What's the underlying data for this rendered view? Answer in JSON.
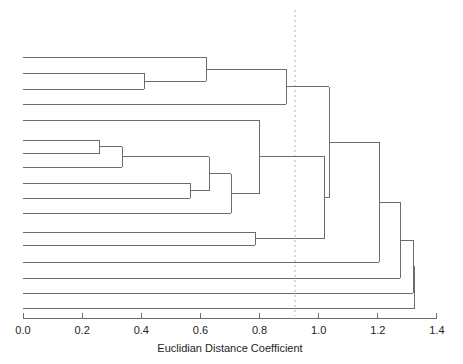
{
  "chart_data": {
    "type": "dendrogram",
    "title": "",
    "xlabel": "Euclidian Distance Coefficient",
    "ylabel": "",
    "xlim": [
      0.0,
      1.4
    ],
    "xticks": [
      0.0,
      0.2,
      0.4,
      0.6,
      0.8,
      1.0,
      1.2,
      1.4
    ],
    "xticklabels": [
      "0.0",
      "0.2",
      "0.4",
      "0.6",
      "0.8",
      "1.0",
      "1.2",
      "1.4"
    ],
    "grid": false,
    "legend": null,
    "orientation": "horizontal-left-to-right",
    "leaf_count": 17,
    "leaf_labels": [
      "",
      "",
      "",
      "",
      "",
      "",
      "",
      "",
      "",
      "",
      "",
      "",
      "",
      "",
      "",
      "",
      ""
    ],
    "leaf_order": [
      1,
      2,
      3,
      4,
      5,
      6,
      7,
      8,
      9,
      10,
      11,
      12,
      13,
      14,
      15,
      16,
      17
    ],
    "cut_line": {
      "value": 0.92,
      "style": "dashed",
      "color": "#c9a9a9",
      "label": ""
    },
    "line_color": "#6d6d6d",
    "axis_color": "#6d6d6d",
    "background": "#ffffff",
    "merges": [
      {
        "id": "m1",
        "left": "leaf2",
        "right": "leaf3",
        "height": 0.41
      },
      {
        "id": "m2",
        "left": "leaf1",
        "right": "m1",
        "height": 0.62
      },
      {
        "id": "m3",
        "left": "m2",
        "right": "leaf4",
        "height": 0.89
      },
      {
        "id": "m4",
        "left": "leaf6",
        "right": "leaf7",
        "height": 0.26
      },
      {
        "id": "m5",
        "left": "m4",
        "right": "leaf8",
        "height": 0.335
      },
      {
        "id": "m6",
        "left": "leaf9",
        "right": "leaf10",
        "height": 0.565
      },
      {
        "id": "m7",
        "left": "m5",
        "right": "m6",
        "height": 0.63
      },
      {
        "id": "m8",
        "left": "m7",
        "right": "leaf11",
        "height": 0.705
      },
      {
        "id": "m9",
        "left": "leaf5",
        "right": "m8",
        "height": 0.8
      },
      {
        "id": "m10",
        "left": "leaf12",
        "right": "leaf13",
        "height": 0.785
      },
      {
        "id": "m11",
        "left": "m9",
        "right": "m10",
        "height": 1.02
      },
      {
        "id": "m12",
        "left": "m3",
        "right": "m11",
        "height": 1.035
      },
      {
        "id": "m13",
        "left": "m12",
        "right": "leaf14",
        "height": 1.205
      },
      {
        "id": "m14",
        "left": "m13",
        "right": "leaf15",
        "height": 1.275
      },
      {
        "id": "m15",
        "left": "m14",
        "right": "leaf16",
        "height": 1.32
      },
      {
        "id": "m16",
        "left": "m15",
        "right": "leaf17",
        "height": 1.325
      }
    ],
    "leaves": [
      {
        "id": "leaf1",
        "index": 1,
        "merge_height": 0.62
      },
      {
        "id": "leaf2",
        "index": 2,
        "merge_height": 0.41
      },
      {
        "id": "leaf3",
        "index": 3,
        "merge_height": 0.41
      },
      {
        "id": "leaf4",
        "index": 4,
        "merge_height": 0.89
      },
      {
        "id": "leaf5",
        "index": 5,
        "merge_height": 0.8
      },
      {
        "id": "leaf6",
        "index": 6,
        "merge_height": 0.26
      },
      {
        "id": "leaf7",
        "index": 7,
        "merge_height": 0.26
      },
      {
        "id": "leaf8",
        "index": 8,
        "merge_height": 0.335
      },
      {
        "id": "leaf9",
        "index": 9,
        "merge_height": 0.565
      },
      {
        "id": "leaf10",
        "index": 10,
        "merge_height": 0.565
      },
      {
        "id": "leaf11",
        "index": 11,
        "merge_height": 0.705
      },
      {
        "id": "leaf12",
        "index": 12,
        "merge_height": 0.785
      },
      {
        "id": "leaf13",
        "index": 13,
        "merge_height": 0.785
      },
      {
        "id": "leaf14",
        "index": 14,
        "merge_height": 1.205
      },
      {
        "id": "leaf15",
        "index": 15,
        "merge_height": 1.275
      },
      {
        "id": "leaf16",
        "index": 16,
        "merge_height": 1.32
      },
      {
        "id": "leaf17",
        "index": 17,
        "merge_height": 1.325
      }
    ]
  },
  "geometry": {
    "x_zero_px": 23,
    "x_per_unit_px": 295.7,
    "leaf_y_px": [
      57,
      73,
      89,
      104,
      120,
      140,
      153,
      167,
      183,
      198,
      213,
      232,
      245,
      262,
      278,
      293,
      308
    ],
    "axis_y_px": 318,
    "tick_len_px": 5,
    "tick_label_y_px": 334,
    "axis_title_y_px": 352
  }
}
